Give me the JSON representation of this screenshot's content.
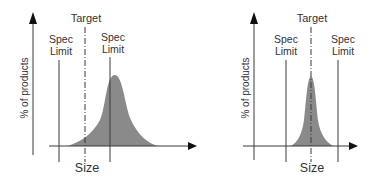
{
  "diagrams": [
    {
      "id": "off-target",
      "y_axis_label": "% of products",
      "x_axis_label": "Size",
      "target_label": "Target",
      "spec_limit_left": {
        "line1": "Spec",
        "line2": "Limit"
      },
      "spec_limit_right": {
        "line1": "Spec",
        "line2": "Limit"
      }
    },
    {
      "id": "on-target",
      "y_axis_label": "% of products",
      "x_axis_label": "Size",
      "target_label": "Target",
      "spec_limit_left": {
        "line1": "Spec",
        "line2": "Limit"
      },
      "spec_limit_right": {
        "line1": "Spec",
        "line2": "Limit"
      }
    }
  ],
  "colors": {
    "curve_fill": "#8a8a8a",
    "line": "#3a3a3a",
    "text": "#333333"
  }
}
